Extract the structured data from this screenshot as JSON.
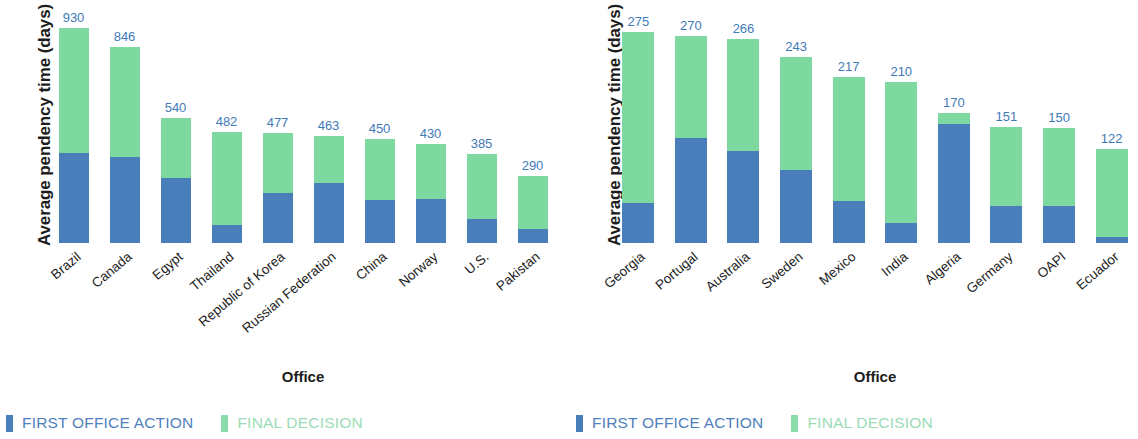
{
  "colors": {
    "first_office_action": "#4a7ebb",
    "final_decision": "#7ed9a0",
    "value_label": "#3f7ab8",
    "legend_final_text": "#9bdcb6",
    "background": "#ffffff"
  },
  "legend": {
    "first_office_action": "FIRST OFFICE ACTION",
    "final_decision": "FINAL DECISION"
  },
  "axis": {
    "ylabel": "Average pendency time (days)",
    "xlabel": "Office"
  },
  "chart_data": [
    {
      "type": "bar",
      "subtype": "stacked",
      "panel": "left",
      "title": "",
      "xlabel": "Office",
      "ylabel": "Average pendency time (days)",
      "ylim": [
        0,
        930
      ],
      "grid": false,
      "yticks_visible": false,
      "legend_position": "bottom-left",
      "categories": [
        "Brazil",
        "Canada",
        "Egypt",
        "Thailand",
        "Republic of Korea",
        "Russian Federation",
        "China",
        "Norway",
        "U.S.",
        "Pakistan"
      ],
      "series": [
        {
          "name": "FIRST OFFICE ACTION",
          "color": "#4a7ebb",
          "values": [
            390,
            370,
            280,
            80,
            215,
            260,
            185,
            190,
            105,
            60
          ]
        },
        {
          "name": "FINAL DECISION",
          "color": "#7ed9a0",
          "values": [
            540,
            476,
            260,
            402,
            262,
            203,
            265,
            240,
            280,
            230
          ]
        }
      ],
      "totals": [
        930,
        846,
        540,
        482,
        477,
        463,
        450,
        430,
        385,
        290
      ],
      "data_labels": [
        "930",
        "846",
        "540",
        "482",
        "477",
        "463",
        "450",
        "430",
        "385",
        "290"
      ]
    },
    {
      "type": "bar",
      "subtype": "stacked",
      "panel": "right",
      "title": "",
      "xlabel": "Office",
      "ylabel": "Average pendency time (days)",
      "ylim": [
        0,
        275
      ],
      "grid": false,
      "yticks_visible": false,
      "legend_position": "bottom-left",
      "categories": [
        "Georgia",
        "Portugal",
        "Australia",
        "Sweden",
        "Mexico",
        "India",
        "Algeria",
        "Germany",
        "OAPI",
        "Ecuador"
      ],
      "series": [
        {
          "name": "FIRST OFFICE ACTION",
          "color": "#4a7ebb",
          "values": [
            52,
            137,
            120,
            95,
            55,
            26,
            155,
            48,
            48,
            8
          ]
        },
        {
          "name": "FINAL DECISION",
          "color": "#7ed9a0",
          "values": [
            223,
            133,
            146,
            148,
            162,
            184,
            15,
            103,
            102,
            114
          ]
        }
      ],
      "totals": [
        275,
        270,
        266,
        243,
        217,
        210,
        170,
        151,
        150,
        122
      ],
      "data_labels": [
        "275",
        "270",
        "266",
        "243",
        "217",
        "210",
        "170",
        "151",
        "150",
        "122"
      ]
    }
  ]
}
